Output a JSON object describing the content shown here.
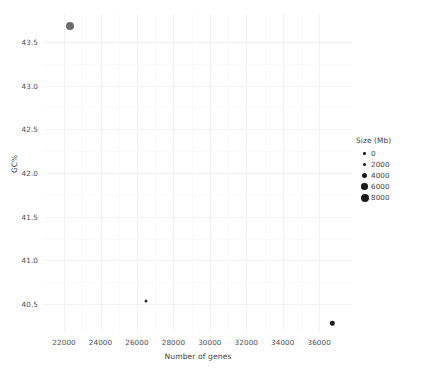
{
  "chart_data": {
    "type": "scatter",
    "title": "",
    "xlabel": "Number of genes",
    "ylabel": "GC%",
    "xlim": [
      20900,
      37800
    ],
    "ylim": [
      40.18,
      43.82
    ],
    "xticks": [
      22000,
      24000,
      26000,
      28000,
      30000,
      32000,
      34000,
      36000
    ],
    "xtick_labels": [
      "22000",
      "24000",
      "26000",
      "28000",
      "30000",
      "32000",
      "34000",
      "36000"
    ],
    "yticks": [
      40.5,
      41.0,
      41.5,
      42.0,
      42.5,
      43.0,
      43.5
    ],
    "ytick_labels": [
      "40.5",
      "41.0",
      "41.5",
      "42.0",
      "42.5",
      "43.0",
      "43.5"
    ],
    "grid": true,
    "grid_color": "#f2f2f4",
    "panel_background": "#ffffff",
    "point_color": "#4d4d4d",
    "points": [
      {
        "x": 22300,
        "y": 43.68,
        "size": 6100,
        "radius_px": 4.0,
        "color": "#6b6b6b"
      },
      {
        "x": 26520,
        "y": 40.54,
        "size": 500,
        "radius_px": 1.5,
        "color": "#2b2b2b"
      },
      {
        "x": 36720,
        "y": 40.28,
        "size": 1400,
        "radius_px": 2.2,
        "color": "#1f1f1f"
      }
    ],
    "legend": {
      "title": "Size (Mb)",
      "position": "right",
      "entries": [
        {
          "label": "0",
          "value": 0,
          "radius_px": 1.3
        },
        {
          "label": "2000",
          "value": 2000,
          "radius_px": 1.9
        },
        {
          "label": "4000",
          "value": 4000,
          "radius_px": 2.6
        },
        {
          "label": "6000",
          "value": 6000,
          "radius_px": 3.3
        },
        {
          "label": "8000",
          "value": 8000,
          "radius_px": 4.0
        }
      ]
    }
  }
}
